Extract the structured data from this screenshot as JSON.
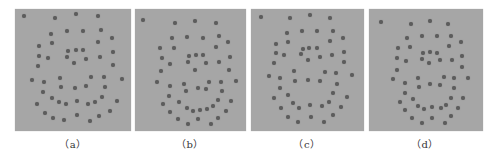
{
  "figure": {
    "background": "#ffffff",
    "panel_color": "#a6a6a6",
    "dot_color": "#5c5c5c",
    "panels": [
      {
        "id": "a",
        "label": "（a）",
        "x": 15,
        "w": 116,
        "label_cx": 73,
        "dots": [
          [
            9,
            7
          ],
          [
            40,
            9
          ],
          [
            61,
            5
          ],
          [
            83,
            7
          ],
          [
            36,
            25
          ],
          [
            52,
            22
          ],
          [
            68,
            22
          ],
          [
            86,
            21
          ],
          [
            97,
            29
          ],
          [
            83,
            33
          ],
          [
            24,
            37
          ],
          [
            37,
            34
          ],
          [
            53,
            42
          ],
          [
            61,
            41
          ],
          [
            68,
            41
          ],
          [
            98,
            43
          ],
          [
            24,
            47
          ],
          [
            33,
            49
          ],
          [
            52,
            48
          ],
          [
            71,
            50
          ],
          [
            85,
            48
          ],
          [
            59,
            54
          ],
          [
            98,
            56
          ],
          [
            23,
            57
          ],
          [
            17,
            71
          ],
          [
            29,
            73
          ],
          [
            45,
            69
          ],
          [
            76,
            68
          ],
          [
            89,
            68
          ],
          [
            107,
            70
          ],
          [
            28,
            83
          ],
          [
            46,
            78
          ],
          [
            60,
            79
          ],
          [
            71,
            77
          ],
          [
            90,
            78
          ],
          [
            37,
            89
          ],
          [
            44,
            93
          ],
          [
            51,
            95
          ],
          [
            62,
            92
          ],
          [
            73,
            95
          ],
          [
            80,
            93
          ],
          [
            87,
            88
          ],
          [
            102,
            92
          ],
          [
            22,
            95
          ],
          [
            30,
            104
          ],
          [
            38,
            109
          ],
          [
            49,
            111
          ],
          [
            62,
            106
          ],
          [
            75,
            112
          ],
          [
            84,
            107
          ],
          [
            95,
            102
          ]
        ]
      },
      {
        "id": "b",
        "label": "（b）",
        "x": 135,
        "w": 111,
        "label_cx": 190,
        "dots": [
          [
            8,
            11
          ],
          [
            40,
            14
          ],
          [
            60,
            12
          ],
          [
            81,
            14
          ],
          [
            37,
            29
          ],
          [
            52,
            28
          ],
          [
            68,
            29
          ],
          [
            84,
            27
          ],
          [
            93,
            33
          ],
          [
            81,
            38
          ],
          [
            25,
            39
          ],
          [
            39,
            39
          ],
          [
            27,
            49
          ],
          [
            54,
            47
          ],
          [
            61,
            46
          ],
          [
            68,
            46
          ],
          [
            95,
            48
          ],
          [
            35,
            55
          ],
          [
            53,
            53
          ],
          [
            71,
            54
          ],
          [
            84,
            53
          ],
          [
            60,
            61
          ],
          [
            94,
            61
          ],
          [
            26,
            62
          ],
          [
            22,
            73
          ],
          [
            35,
            77
          ],
          [
            49,
            75
          ],
          [
            74,
            73
          ],
          [
            86,
            73
          ],
          [
            101,
            72
          ],
          [
            63,
            79
          ],
          [
            51,
            82
          ],
          [
            71,
            80
          ],
          [
            87,
            82
          ],
          [
            34,
            87
          ],
          [
            83,
            91
          ],
          [
            44,
            93
          ],
          [
            96,
            92
          ],
          [
            28,
            95
          ],
          [
            52,
            99
          ],
          [
            58,
            102
          ],
          [
            65,
            101
          ],
          [
            72,
            100
          ],
          [
            78,
            97
          ],
          [
            91,
            102
          ],
          [
            35,
            103
          ],
          [
            43,
            110
          ],
          [
            63,
            110
          ],
          [
            83,
            109
          ],
          [
            53,
            115
          ],
          [
            76,
            115
          ]
        ]
      },
      {
        "id": "c",
        "label": "（c）",
        "x": 251,
        "w": 113,
        "label_cx": 307,
        "dots": [
          [
            10,
            8
          ],
          [
            39,
            9
          ],
          [
            59,
            6
          ],
          [
            79,
            9
          ],
          [
            36,
            24
          ],
          [
            51,
            22
          ],
          [
            66,
            22
          ],
          [
            82,
            22
          ],
          [
            92,
            29
          ],
          [
            79,
            32
          ],
          [
            25,
            35
          ],
          [
            37,
            33
          ],
          [
            52,
            40
          ],
          [
            58,
            39
          ],
          [
            66,
            39
          ],
          [
            93,
            43
          ],
          [
            25,
            44
          ],
          [
            33,
            46
          ],
          [
            50,
            45
          ],
          [
            69,
            48
          ],
          [
            81,
            46
          ],
          [
            57,
            51
          ],
          [
            93,
            53
          ],
          [
            23,
            54
          ],
          [
            18,
            67
          ],
          [
            29,
            69
          ],
          [
            43,
            62
          ],
          [
            74,
            63
          ],
          [
            85,
            64
          ],
          [
            101,
            66
          ],
          [
            44,
            72
          ],
          [
            57,
            71
          ],
          [
            69,
            72
          ],
          [
            86,
            75
          ],
          [
            29,
            79
          ],
          [
            82,
            84
          ],
          [
            37,
            86
          ],
          [
            23,
            89
          ],
          [
            96,
            88
          ],
          [
            42,
            94
          ],
          [
            48,
            99
          ],
          [
            59,
            96
          ],
          [
            71,
            97
          ],
          [
            78,
            93
          ],
          [
            90,
            98
          ],
          [
            30,
            99
          ],
          [
            37,
            108
          ],
          [
            60,
            108
          ],
          [
            82,
            106
          ],
          [
            47,
            113
          ],
          [
            73,
            113
          ]
        ]
      },
      {
        "id": "d",
        "label": "（d）",
        "x": 369,
        "w": 114,
        "label_cx": 425,
        "dots": [
          [
            12,
            13
          ],
          [
            42,
            15
          ],
          [
            61,
            12
          ],
          [
            79,
            15
          ],
          [
            38,
            29
          ],
          [
            53,
            27
          ],
          [
            68,
            27
          ],
          [
            82,
            27
          ],
          [
            92,
            33
          ],
          [
            80,
            37
          ],
          [
            29,
            39
          ],
          [
            41,
            38
          ],
          [
            54,
            44
          ],
          [
            61,
            43
          ],
          [
            68,
            44
          ],
          [
            93,
            47
          ],
          [
            28,
            49
          ],
          [
            37,
            52
          ],
          [
            53,
            50
          ],
          [
            71,
            51
          ],
          [
            83,
            51
          ],
          [
            60,
            54
          ],
          [
            93,
            58
          ],
          [
            28,
            61
          ],
          [
            24,
            70
          ],
          [
            36,
            74
          ],
          [
            49,
            69
          ],
          [
            75,
            68
          ],
          [
            85,
            69
          ],
          [
            99,
            69
          ],
          [
            50,
            78
          ],
          [
            61,
            75
          ],
          [
            71,
            76
          ],
          [
            85,
            79
          ],
          [
            36,
            84
          ],
          [
            82,
            89
          ],
          [
            44,
            90
          ],
          [
            94,
            89
          ],
          [
            31,
            93
          ],
          [
            49,
            97
          ],
          [
            55,
            100
          ],
          [
            63,
            98
          ],
          [
            72,
            99
          ],
          [
            77,
            96
          ],
          [
            89,
            99
          ],
          [
            36,
            101
          ],
          [
            43,
            109
          ],
          [
            63,
            109
          ],
          [
            82,
            107
          ],
          [
            53,
            114
          ],
          [
            76,
            114
          ]
        ]
      }
    ]
  }
}
